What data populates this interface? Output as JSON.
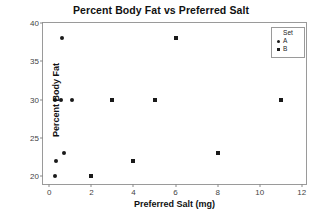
{
  "chart_data": {
    "type": "scatter",
    "title": "Percent Body Fat vs Preferred Salt",
    "xlabel": "Preferred Salt (mg)",
    "ylabel": "Percent Body Fat",
    "xlim": [
      -0.3,
      12.2
    ],
    "ylim": [
      19.0,
      40.0
    ],
    "xticks": [
      "0",
      "2",
      "4",
      "6",
      "8",
      "10",
      "12"
    ],
    "xtick_values": [
      0,
      2,
      4,
      6,
      8,
      10,
      12
    ],
    "yticks": [
      "20",
      "25",
      "30",
      "35",
      "40"
    ],
    "ytick_values": [
      20,
      25,
      30,
      35,
      40
    ],
    "grid": false,
    "legend": {
      "title": "Set",
      "position": "top-right",
      "entries": [
        {
          "label": "A",
          "marker": "circle",
          "color": "#1a1a1a"
        },
        {
          "label": "B",
          "marker": "square",
          "color": "#1a1a1a"
        }
      ]
    },
    "series": [
      {
        "name": "A",
        "marker": "circle",
        "color": "#1a1a1a",
        "points": [
          {
            "x": 0.25,
            "y": 30
          },
          {
            "x": 0.55,
            "y": 30
          },
          {
            "x": 1.1,
            "y": 30
          },
          {
            "x": 0.6,
            "y": 38
          },
          {
            "x": 0.3,
            "y": 22
          },
          {
            "x": 0.7,
            "y": 23
          },
          {
            "x": 0.25,
            "y": 20
          }
        ]
      },
      {
        "name": "B",
        "marker": "square",
        "color": "#1a1a1a",
        "points": [
          {
            "x": 2.0,
            "y": 20
          },
          {
            "x": 3.0,
            "y": 30
          },
          {
            "x": 4.0,
            "y": 22
          },
          {
            "x": 5.0,
            "y": 30
          },
          {
            "x": 6.0,
            "y": 38
          },
          {
            "x": 8.0,
            "y": 23
          },
          {
            "x": 11.0,
            "y": 30
          }
        ]
      }
    ]
  }
}
